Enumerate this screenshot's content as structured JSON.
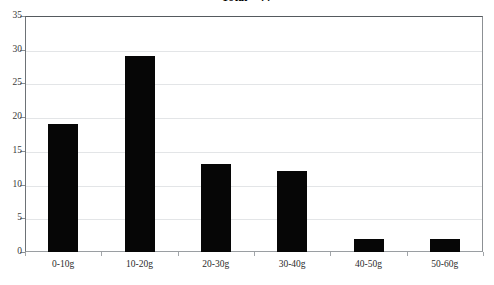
{
  "chart_data": {
    "type": "bar",
    "title": "Total = 77",
    "xlabel": "",
    "ylabel": "",
    "categories": [
      "0-10g",
      "10-20g",
      "20-30g",
      "30-40g",
      "40-50g",
      "50-60g"
    ],
    "values": [
      19,
      29,
      13,
      12,
      2,
      2
    ],
    "ylim": [
      0,
      35
    ],
    "ytick_labels": [
      "0",
      "5",
      "10",
      "15",
      "20",
      "25",
      "30",
      "35"
    ],
    "ytick_values": [
      0,
      5,
      10,
      15,
      20,
      25,
      30,
      35
    ],
    "grid": true,
    "legend": false,
    "bar_color": "#060606",
    "grid_color": "#e3e5e7",
    "axis_color": "#8a8e92",
    "background_color": "#ffffff"
  }
}
